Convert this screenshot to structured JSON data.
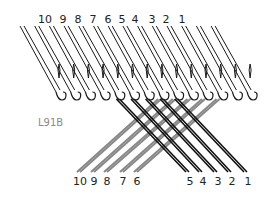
{
  "diagram": {
    "code_label": "L91B",
    "top_labels": [
      {
        "text": "10",
        "x": 45
      },
      {
        "text": "9",
        "x": 63
      },
      {
        "text": "8",
        "x": 78
      },
      {
        "text": "7",
        "x": 93
      },
      {
        "text": "6",
        "x": 108
      },
      {
        "text": "5",
        "x": 122
      },
      {
        "text": "4",
        "x": 135
      },
      {
        "text": "3",
        "x": 152
      },
      {
        "text": "2",
        "x": 166
      },
      {
        "text": "1",
        "x": 182
      }
    ],
    "bottom_labels": [
      {
        "text": "10",
        "x": 80
      },
      {
        "text": "9",
        "x": 94
      },
      {
        "text": "8",
        "x": 107
      },
      {
        "text": "7",
        "x": 123
      },
      {
        "text": "6",
        "x": 137
      },
      {
        "text": "5",
        "x": 190
      },
      {
        "text": "4",
        "x": 203
      },
      {
        "text": "3",
        "x": 218
      },
      {
        "text": "2",
        "x": 232
      },
      {
        "text": "1",
        "x": 248
      }
    ],
    "needle_count": 14,
    "colors": {
      "needle": "#1a1a1a",
      "yarn_dark": "#111111",
      "yarn_light": "#888888",
      "code": "#8a8a8a"
    }
  }
}
